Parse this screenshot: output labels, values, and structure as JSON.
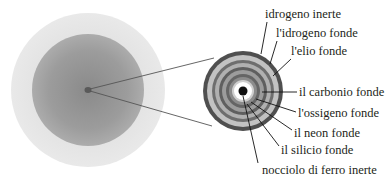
{
  "diagram": {
    "title": "",
    "star": {
      "outer_color": "#e4e4e4",
      "inner_color": "#9a9a9a",
      "core_marker_color": "#5a5a5a"
    },
    "core_detail": {
      "rings_outer_to_inner": [
        {
          "color": "#4f4f4f",
          "r": 40
        },
        {
          "color": "#c2c2c2",
          "r": 36
        },
        {
          "color": "#6e6e6e",
          "r": 31
        },
        {
          "color": "#b0b0b0",
          "r": 28
        },
        {
          "color": "#5f5f5f",
          "r": 24
        },
        {
          "color": "#9c9c9c",
          "r": 21
        },
        {
          "color": "#656565",
          "r": 17
        },
        {
          "color": "#8c8c8c",
          "r": 14
        },
        {
          "color": "#cfcfcf",
          "r": 11
        },
        {
          "color": "#ffffff",
          "r": 9
        },
        {
          "color": "#111111",
          "r": 4.5
        }
      ]
    },
    "labels": [
      {
        "text": "idrogeno inerte"
      },
      {
        "text": "l'idrogeno fonde"
      },
      {
        "text": "l'elio fonde"
      },
      {
        "text": "il carbonio fonde"
      },
      {
        "text": "l'ossigeno fonde"
      },
      {
        "text": "il neon fonde"
      },
      {
        "text": "il silicio fonde"
      },
      {
        "text": "nocciolo di ferro inerte"
      }
    ]
  }
}
